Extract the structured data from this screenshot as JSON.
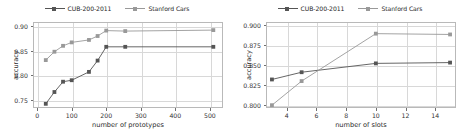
{
  "figure": {
    "width": 467,
    "height": 136,
    "background": "#ffffff",
    "panel_count": 2
  },
  "colors": {
    "cub_series": "#555555",
    "cars_series": "#999999",
    "grid": "#d8d8d8",
    "frame": "#b9b9b9",
    "text": "#262626"
  },
  "legend": {
    "position": "above-axes-center",
    "entries": [
      {
        "label": "CUB-200-2011",
        "color": "#555555",
        "marker": "square"
      },
      {
        "label": "Stanford Cars",
        "color": "#999999",
        "marker": "square"
      }
    ]
  },
  "chart_data": [
    {
      "type": "line",
      "panel": "left",
      "title": "",
      "xlabel": "number of prototypes",
      "ylabel": "accuracy",
      "xlim": [
        -12,
        538
      ],
      "ylim": [
        0.7335,
        0.9085
      ],
      "xticks": [
        0,
        100,
        200,
        300,
        400,
        500
      ],
      "xticklabels": [
        "0",
        "100",
        "200",
        "300",
        "400",
        "500"
      ],
      "yticks": [
        0.75,
        0.8,
        0.85,
        0.9
      ],
      "yticklabels": [
        "0.75",
        "0.80",
        "0.85",
        "0.90"
      ],
      "grid": true,
      "legend_position": "upper-center-outside",
      "series": [
        {
          "name": "CUB-200-2011",
          "color": "#555555",
          "marker": "square",
          "x": [
            25,
            50,
            75,
            100,
            150,
            175,
            200,
            255,
            510
          ],
          "y": [
            0.742,
            0.766,
            0.787,
            0.79,
            0.807,
            0.83,
            0.858,
            0.858,
            0.858
          ]
        },
        {
          "name": "Stanford Cars",
          "color": "#999999",
          "marker": "square",
          "x": [
            25,
            50,
            75,
            100,
            150,
            175,
            200,
            255,
            510
          ],
          "y": [
            0.831,
            0.848,
            0.86,
            0.867,
            0.872,
            0.88,
            0.891,
            0.89,
            0.892
          ]
        }
      ]
    },
    {
      "type": "line",
      "panel": "right",
      "title": "",
      "xlabel": "number of slots",
      "ylabel": "accuracy",
      "xlim": [
        2.6,
        15.4
      ],
      "ylim": [
        0.7965,
        0.9035
      ],
      "xticks": [
        4,
        6,
        8,
        10,
        12,
        14
      ],
      "xticklabels": [
        "4",
        "6",
        "8",
        "10",
        "12",
        "14"
      ],
      "yticks": [
        0.8,
        0.825,
        0.85,
        0.875,
        0.9
      ],
      "yticklabels": [
        "0.800",
        "0.825",
        "0.850",
        "0.875",
        "0.900"
      ],
      "grid": true,
      "legend_position": "upper-center-outside",
      "series": [
        {
          "name": "CUB-200-2011",
          "color": "#555555",
          "marker": "square",
          "x": [
            3,
            5,
            10,
            15
          ],
          "y": [
            0.832,
            0.841,
            0.852,
            0.853
          ]
        },
        {
          "name": "Stanford Cars",
          "color": "#999999",
          "marker": "square",
          "x": [
            3,
            5,
            10,
            15
          ],
          "y": [
            0.8,
            0.83,
            0.889,
            0.888
          ]
        }
      ]
    }
  ]
}
